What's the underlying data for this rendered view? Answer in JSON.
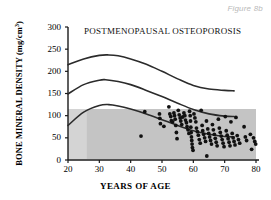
{
  "figure": {
    "caption": "Figure 8b"
  },
  "chart_data": {
    "type": "scatter",
    "title": "POSTMENOPAUSAL OSTEOPOROSIS",
    "xlabel": "YEARS OF AGE",
    "ylabel": "BONE MINERAL DENSITY (mg/cm",
    "ylabel_exponent": "3",
    "ylabel_close": ")",
    "xlim": [
      20,
      80
    ],
    "ylim": [
      0,
      300
    ],
    "xticks": [
      20,
      30,
      40,
      50,
      60,
      70,
      80
    ],
    "yticks": [
      0,
      50,
      100,
      150,
      200,
      250,
      300
    ],
    "grid": false,
    "legend": "none",
    "colors": {
      "curve": "#2b2b2b",
      "point": "#111111",
      "band": "#c4c4c4",
      "band_light": "#d4d4d4",
      "axis": "#1a1a1a",
      "caption": "#b9b9b9"
    },
    "shaded_band": {
      "label": "fracture-risk band",
      "x_start": 20,
      "x_end": 80,
      "y_bottom": 2,
      "y_top": 115,
      "light_x_start": 20,
      "light_x_end": 26
    },
    "series": [
      {
        "name": "upper percentile curve",
        "type": "line",
        "x": [
          20,
          25,
          30,
          33,
          36,
          40,
          45,
          50,
          55,
          60,
          65,
          70,
          73
        ],
        "y": [
          215,
          228,
          236,
          237,
          235,
          228,
          216,
          200,
          183,
          168,
          160,
          157,
          156
        ]
      },
      {
        "name": "mean curve",
        "type": "line",
        "x": [
          20,
          25,
          30,
          32,
          36,
          40,
          45,
          50,
          55,
          60,
          65,
          70,
          73
        ],
        "y": [
          149,
          170,
          180,
          181,
          177,
          170,
          157,
          143,
          128,
          114,
          104,
          99,
          98
        ]
      },
      {
        "name": "lower percentile curve",
        "type": "line",
        "x": [
          20,
          25,
          30,
          33,
          36,
          40,
          45,
          50,
          55,
          60,
          65,
          70,
          73
        ],
        "y": [
          78,
          108,
          123,
          125,
          122,
          115,
          104,
          91,
          78,
          66,
          58,
          53,
          52
        ]
      }
    ],
    "points": [
      {
        "x": 43.3,
        "y": 54
      },
      {
        "x": 44.5,
        "y": 109
      },
      {
        "x": 49.2,
        "y": 104
      },
      {
        "x": 49.3,
        "y": 94
      },
      {
        "x": 49.5,
        "y": 82
      },
      {
        "x": 50.6,
        "y": 76
      },
      {
        "x": 52.2,
        "y": 120
      },
      {
        "x": 52.5,
        "y": 104
      },
      {
        "x": 52.8,
        "y": 98
      },
      {
        "x": 53.0,
        "y": 89
      },
      {
        "x": 53.4,
        "y": 86
      },
      {
        "x": 53.8,
        "y": 106
      },
      {
        "x": 54.0,
        "y": 100
      },
      {
        "x": 54.2,
        "y": 92
      },
      {
        "x": 54.4,
        "y": 78
      },
      {
        "x": 54.6,
        "y": 62
      },
      {
        "x": 54.8,
        "y": 48
      },
      {
        "x": 55.2,
        "y": 112
      },
      {
        "x": 55.5,
        "y": 102
      },
      {
        "x": 55.8,
        "y": 95
      },
      {
        "x": 56.0,
        "y": 88
      },
      {
        "x": 56.3,
        "y": 80
      },
      {
        "x": 56.6,
        "y": 97
      },
      {
        "x": 57.0,
        "y": 106
      },
      {
        "x": 57.3,
        "y": 100
      },
      {
        "x": 57.5,
        "y": 90
      },
      {
        "x": 57.8,
        "y": 84
      },
      {
        "x": 58.0,
        "y": 75
      },
      {
        "x": 58.3,
        "y": 68
      },
      {
        "x": 58.6,
        "y": 60
      },
      {
        "x": 58.8,
        "y": 110
      },
      {
        "x": 59.0,
        "y": 100
      },
      {
        "x": 59.1,
        "y": 88
      },
      {
        "x": 59.2,
        "y": 74
      },
      {
        "x": 59.3,
        "y": 62
      },
      {
        "x": 59.4,
        "y": 52
      },
      {
        "x": 59.5,
        "y": 44
      },
      {
        "x": 59.6,
        "y": 36
      },
      {
        "x": 59.7,
        "y": 28
      },
      {
        "x": 59.9,
        "y": 22
      },
      {
        "x": 60.2,
        "y": 104
      },
      {
        "x": 60.5,
        "y": 95
      },
      {
        "x": 60.8,
        "y": 86
      },
      {
        "x": 61.0,
        "y": 72
      },
      {
        "x": 61.3,
        "y": 64
      },
      {
        "x": 61.6,
        "y": 56
      },
      {
        "x": 61.9,
        "y": 46
      },
      {
        "x": 62.2,
        "y": 38
      },
      {
        "x": 62.5,
        "y": 112
      },
      {
        "x": 62.8,
        "y": 78
      },
      {
        "x": 63.0,
        "y": 66
      },
      {
        "x": 63.3,
        "y": 58
      },
      {
        "x": 63.6,
        "y": 50
      },
      {
        "x": 63.9,
        "y": 42
      },
      {
        "x": 64.2,
        "y": 88
      },
      {
        "x": 64.3,
        "y": 9
      },
      {
        "x": 64.6,
        "y": 70
      },
      {
        "x": 64.9,
        "y": 60
      },
      {
        "x": 65.2,
        "y": 52
      },
      {
        "x": 65.5,
        "y": 44
      },
      {
        "x": 65.8,
        "y": 36
      },
      {
        "x": 66.1,
        "y": 80
      },
      {
        "x": 66.4,
        "y": 68
      },
      {
        "x": 66.7,
        "y": 58
      },
      {
        "x": 67.0,
        "y": 49
      },
      {
        "x": 67.3,
        "y": 40
      },
      {
        "x": 67.6,
        "y": 32
      },
      {
        "x": 68.0,
        "y": 92
      },
      {
        "x": 68.3,
        "y": 72
      },
      {
        "x": 68.6,
        "y": 62
      },
      {
        "x": 68.9,
        "y": 54
      },
      {
        "x": 69.2,
        "y": 46
      },
      {
        "x": 69.5,
        "y": 38
      },
      {
        "x": 69.8,
        "y": 30
      },
      {
        "x": 70.2,
        "y": 98
      },
      {
        "x": 70.5,
        "y": 66
      },
      {
        "x": 70.8,
        "y": 56
      },
      {
        "x": 71.1,
        "y": 48
      },
      {
        "x": 71.4,
        "y": 40
      },
      {
        "x": 71.7,
        "y": 32
      },
      {
        "x": 72.0,
        "y": 86
      },
      {
        "x": 72.4,
        "y": 60
      },
      {
        "x": 72.7,
        "y": 50
      },
      {
        "x": 73.0,
        "y": 42
      },
      {
        "x": 73.3,
        "y": 34
      },
      {
        "x": 73.6,
        "y": 96
      },
      {
        "x": 74.0,
        "y": 55
      },
      {
        "x": 74.4,
        "y": 46
      },
      {
        "x": 74.8,
        "y": 38
      },
      {
        "x": 76.2,
        "y": 75
      },
      {
        "x": 76.6,
        "y": 52
      },
      {
        "x": 77.0,
        "y": 44
      },
      {
        "x": 78.2,
        "y": 58
      },
      {
        "x": 78.6,
        "y": 24
      },
      {
        "x": 79.2,
        "y": 50
      },
      {
        "x": 79.6,
        "y": 42
      },
      {
        "x": 79.9,
        "y": 36
      }
    ]
  }
}
